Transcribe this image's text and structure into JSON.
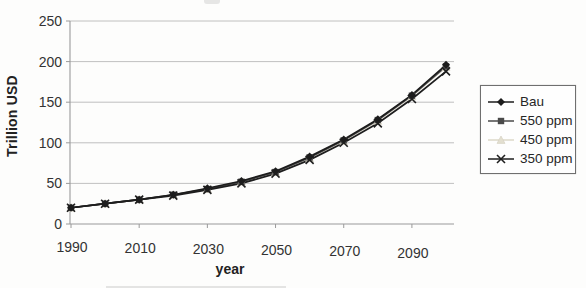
{
  "page": {
    "background": "#fdfdfc"
  },
  "chart_data": {
    "type": "line",
    "title": "",
    "xlabel": "year",
    "ylabel": "Trillion USD",
    "x": [
      1990,
      2000,
      2010,
      2020,
      2030,
      2040,
      2050,
      2060,
      2070,
      2080,
      2090,
      2100
    ],
    "series": [
      {
        "name": "Bau",
        "marker": "diamond",
        "color": "#1c1c1c",
        "values": [
          20,
          25,
          30,
          36,
          44,
          53,
          65,
          83,
          104,
          129,
          159,
          196
        ]
      },
      {
        "name": "550 ppm",
        "marker": "square",
        "color": "#4a4a4a",
        "values": [
          20,
          25,
          30,
          36,
          43,
          52,
          64,
          82,
          103,
          128,
          158,
          194
        ]
      },
      {
        "name": "450 ppm",
        "marker": "triangle",
        "color": "#e3dfd0",
        "values": [
          20,
          25,
          30,
          36,
          43,
          52,
          64,
          81,
          102,
          127,
          157,
          193
        ]
      },
      {
        "name": "350 ppm",
        "marker": "x",
        "color": "#1e1e1e",
        "values": [
          20,
          25,
          30,
          35,
          42,
          50,
          62,
          79,
          100,
          124,
          154,
          188
        ]
      }
    ],
    "ylim": [
      0,
      250
    ],
    "yticks": [
      0,
      50,
      100,
      150,
      200,
      250
    ],
    "xticks": [
      1990,
      2010,
      2030,
      2050,
      2070,
      2090
    ],
    "grid": "horizontal",
    "legend_position": "right",
    "gridline_color": "#b9b9b9",
    "axis_color": "#9a9a9a",
    "tick_label_color": "#333333"
  }
}
